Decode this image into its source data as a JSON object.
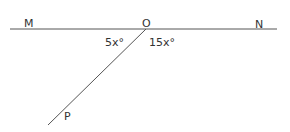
{
  "diagram": {
    "title": "",
    "points": {
      "M": {
        "label": "M"
      },
      "O": {
        "label": "O"
      },
      "N": {
        "label": "N"
      },
      "P": {
        "label": "P"
      }
    },
    "angles": {
      "MOP": {
        "label": "5x°"
      },
      "PON": {
        "label": "15x°"
      }
    },
    "colors": {
      "line": "#555555",
      "text": "#333333",
      "background": "#ffffff"
    }
  }
}
